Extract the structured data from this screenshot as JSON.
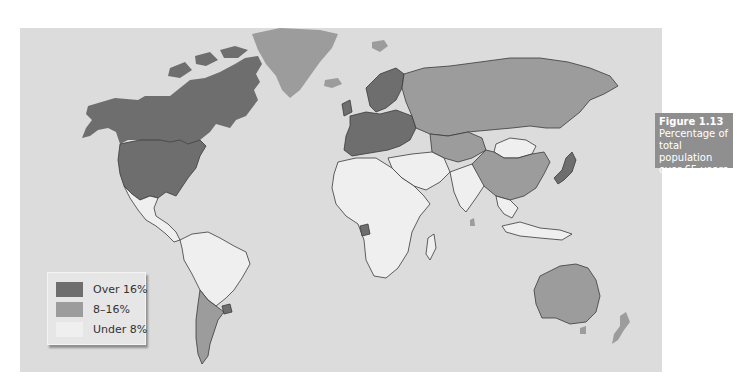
{
  "figure": {
    "number": "Figure 1.13",
    "title": "Percentage of total population over 65 years"
  },
  "legend": {
    "items": [
      {
        "label": "Over 16%",
        "color": "#6e6e6e"
      },
      {
        "label": "8–16%",
        "color": "#9c9c9c"
      },
      {
        "label": "Under 8%",
        "color": "#efefef"
      }
    ]
  },
  "colors": {
    "ocean": "#dcdcdc",
    "over16": "#6e6e6e",
    "mid": "#9c9c9c",
    "under8": "#efefef",
    "border": "#3a3a3a",
    "caption_bg": "#8f8f8f"
  },
  "regions": {
    "over_16": [
      "Canada",
      "United States",
      "Western Europe",
      "Scandinavia",
      "Japan",
      "Uruguay",
      "Gabon"
    ],
    "8_to_16": [
      "Greenland",
      "Russia",
      "Kazakhstan",
      "Central Asia",
      "China",
      "Argentina",
      "Chile",
      "Australia",
      "New Zealand",
      "Iceland",
      "Svalbard",
      "Sri Lanka"
    ],
    "under_8": [
      "Mexico",
      "Central America",
      "South America (north)",
      "Africa",
      "Middle East",
      "India",
      "Southeast Asia",
      "Mongolia",
      "Indonesia",
      "Papua New Guinea"
    ]
  }
}
